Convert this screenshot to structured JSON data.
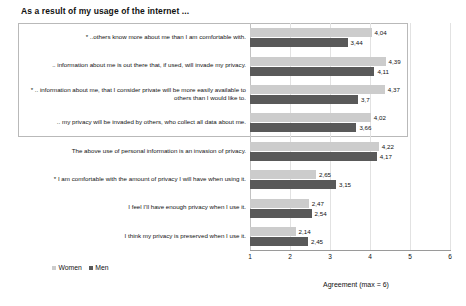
{
  "chart_data": {
    "type": "bar",
    "orientation": "horizontal",
    "title": "As a result of my usage of the internet ...",
    "xlabel": "Agreement (max = 6)",
    "ylabel": "",
    "xlim": [
      1,
      6
    ],
    "xticks": [
      "1",
      "2",
      "3",
      "4",
      "5",
      "6"
    ],
    "grid": true,
    "legend_position": "bottom-left",
    "categories": [
      "* ..others know more about me than I am comfortable with.",
      ".. information about me is out there that, if used, will invade my privacy.",
      "* .. information about me, that I consider private will be more easily available to others than I would like to.",
      ".. my privacy will be invaded by others, who collect all data about me.",
      "The above use of personal information is an invasion of privacy.",
      "* I am comfortable with the amount of privacy I will have when using it.",
      "I feel I'll have enough privacy when I use it.",
      "I think my privacy is preserved when I use it."
    ],
    "series": [
      {
        "name": "Women",
        "color": "#cccccc",
        "values": [
          4.04,
          4.39,
          4.37,
          4.02,
          4.22,
          2.65,
          2.47,
          2.14
        ],
        "labels": [
          "4,04",
          "4,39",
          "4,37",
          "4,02",
          "4,22",
          "2,65",
          "2,47",
          "2,14"
        ]
      },
      {
        "name": "Men",
        "color": "#595959",
        "values": [
          3.44,
          4.11,
          3.7,
          3.66,
          4.17,
          3.15,
          2.54,
          2.45
        ],
        "labels": [
          "3,44",
          "4,11",
          "3,7",
          "3,66",
          "4,17",
          "3,15",
          "2,54",
          "2,45"
        ]
      }
    ],
    "annotations": {
      "highlight_box": "Rectangle outlining the first four categories"
    }
  }
}
